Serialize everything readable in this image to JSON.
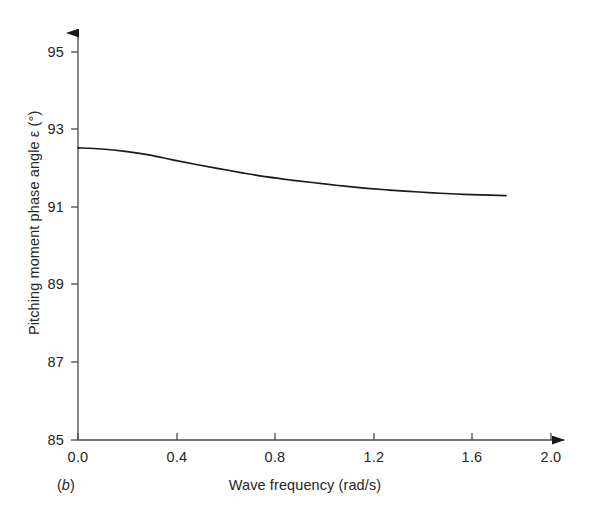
{
  "figure": {
    "panel_label_prefix": "(",
    "panel_label": "b",
    "panel_label_suffix": ")",
    "background_color": "#ffffff",
    "line_color": "#1a1a1a",
    "axis_color": "#404040"
  },
  "chart_data": {
    "type": "line",
    "title": "",
    "subtitle": "",
    "xlabel": "Wave frequency (rad/s)",
    "ylabel": "Pitching moment phase angle ε (°)",
    "xlim": [
      0.0,
      2.0
    ],
    "ylim": [
      85,
      95
    ],
    "xticks": [
      0.0,
      0.4,
      0.8,
      1.2,
      1.6,
      2.0
    ],
    "xticklabels": [
      "0.0",
      "0.4",
      "0.8",
      "1.2",
      "1.6",
      "2.0"
    ],
    "yticks": [
      85,
      87,
      89,
      91,
      93,
      95
    ],
    "yticklabels": [
      "85",
      "87",
      "89",
      "91",
      "93",
      "95"
    ],
    "grid": false,
    "legend": null,
    "legend_position": "none",
    "axis_style": "arrow-terminated-open-axes",
    "annotations": [],
    "series": [
      {
        "name": "Pitching moment phase angle",
        "x": [
          0.0,
          0.1,
          0.2,
          0.3,
          0.4,
          0.5,
          0.6,
          0.7,
          0.8,
          0.9,
          1.0,
          1.1,
          1.2,
          1.3,
          1.4,
          1.5,
          1.6,
          1.7,
          1.81
        ],
        "y": [
          92.53,
          92.5,
          92.44,
          92.35,
          92.22,
          92.1,
          91.99,
          91.88,
          91.78,
          91.7,
          91.63,
          91.56,
          91.5,
          91.45,
          91.41,
          91.37,
          91.34,
          91.32,
          91.3
        ]
      }
    ]
  },
  "axis_labels": {
    "y": [
      "95",
      "93",
      "91",
      "89",
      "87",
      "85"
    ],
    "x": [
      "0.0",
      "0.4",
      "0.8",
      "1.2",
      "1.6",
      "2.0"
    ]
  }
}
